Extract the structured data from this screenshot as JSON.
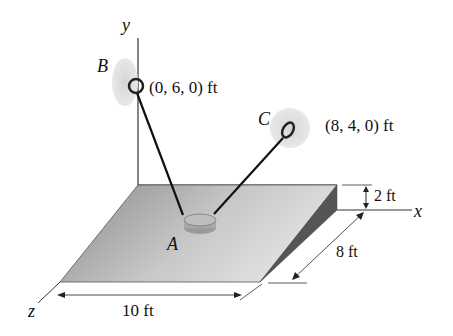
{
  "diagram": {
    "axes": {
      "x": "x",
      "y": "y",
      "z": "z"
    },
    "points": {
      "A": {
        "label": "A"
      },
      "B": {
        "label": "B",
        "coords": "(0, 6, 0) ft"
      },
      "C": {
        "label": "C",
        "coords": "(8, 4, 0) ft"
      }
    },
    "dimensions": {
      "height": "2 ft",
      "depth": "8 ft",
      "width": "10 ft"
    }
  }
}
